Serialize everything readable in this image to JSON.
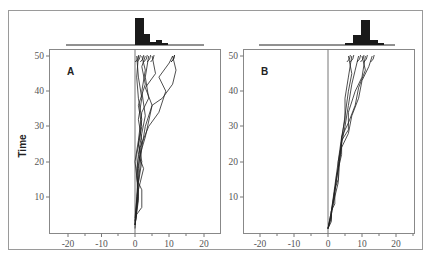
{
  "chart_data": [
    {
      "type": "line",
      "panel_label": "A",
      "title": "",
      "xlabel": "",
      "ylabel": "Time",
      "xlim": [
        -25,
        25
      ],
      "ylim": [
        0,
        52
      ],
      "x_ticks": [
        -20,
        -10,
        0,
        10,
        20
      ],
      "y_ticks": [
        10,
        20,
        30,
        40,
        50
      ],
      "description": "Many random-walk trajectories starting at x=0, t=0; clustered near x=0–5 with a few drifting to x≈10–12 by t=50",
      "series": [
        {
          "name": "path-1",
          "points": [
            [
              0,
              2
            ],
            [
              0.5,
              5
            ],
            [
              2,
              7
            ],
            [
              2,
              12
            ],
            [
              1,
              14
            ],
            [
              2,
              20
            ],
            [
              1,
              25
            ],
            [
              2,
              32
            ],
            [
              1,
              38
            ],
            [
              0.5,
              44
            ],
            [
              1,
              50
            ]
          ]
        },
        {
          "name": "path-2",
          "points": [
            [
              0,
              2
            ],
            [
              0.5,
              6
            ],
            [
              1,
              12
            ],
            [
              2.5,
              18
            ],
            [
              1,
              22
            ],
            [
              2,
              28
            ],
            [
              3,
              33
            ],
            [
              2,
              40
            ],
            [
              3,
              46
            ],
            [
              2,
              50
            ]
          ]
        },
        {
          "name": "path-3",
          "points": [
            [
              0,
              3
            ],
            [
              1,
              10
            ],
            [
              0.5,
              18
            ],
            [
              1.5,
              24
            ],
            [
              4,
              30
            ],
            [
              7,
              34
            ],
            [
              9,
              40
            ],
            [
              7,
              44
            ],
            [
              10,
              48
            ],
            [
              11,
              50
            ]
          ]
        },
        {
          "name": "path-4",
          "points": [
            [
              0,
              2
            ],
            [
              1,
              9
            ],
            [
              0.5,
              16
            ],
            [
              1.5,
              22
            ],
            [
              3,
              27
            ],
            [
              5,
              36
            ],
            [
              3,
              41
            ],
            [
              6,
              45
            ],
            [
              5,
              50
            ]
          ]
        },
        {
          "name": "path-5",
          "points": [
            [
              0,
              1
            ],
            [
              0.5,
              8
            ],
            [
              1,
              15
            ],
            [
              0.5,
              22
            ],
            [
              2,
              30
            ],
            [
              1,
              36
            ],
            [
              3,
              42
            ],
            [
              2,
              47
            ],
            [
              3,
              50
            ]
          ]
        },
        {
          "name": "path-6",
          "points": [
            [
              0,
              3
            ],
            [
              1,
              12
            ],
            [
              0,
              20
            ],
            [
              1,
              26
            ],
            [
              2,
              34
            ],
            [
              4,
              38
            ],
            [
              3,
              44
            ],
            [
              4,
              50
            ]
          ]
        },
        {
          "name": "path-7",
          "points": [
            [
              0,
              2
            ],
            [
              0.5,
              10
            ],
            [
              1,
              18
            ],
            [
              2,
              26
            ],
            [
              1,
              32
            ],
            [
              2,
              38
            ],
            [
              1,
              44
            ],
            [
              0.5,
              50
            ]
          ]
        },
        {
          "name": "path-8",
          "points": [
            [
              0,
              4
            ],
            [
              1,
              14
            ],
            [
              2,
              24
            ],
            [
              3,
              30
            ],
            [
              5,
              36
            ],
            [
              8,
              38
            ],
            [
              11,
              42
            ],
            [
              12,
              46
            ],
            [
              11,
              50
            ]
          ]
        }
      ],
      "histogram": {
        "bin_edges": [
          -20,
          -15,
          -10,
          -5,
          0,
          2.5,
          5,
          7.5,
          10,
          12.5,
          15,
          20
        ],
        "counts": [
          0,
          0,
          0,
          0,
          12,
          6,
          1,
          2,
          0.5,
          0,
          0
        ],
        "description": "Marginal distribution of positions at t=50; tallest bin at 0–2.5, decaying right-skewed"
      }
    },
    {
      "type": "line",
      "panel_label": "B",
      "title": "",
      "xlabel": "",
      "ylabel": "",
      "xlim": [
        -25,
        25
      ],
      "ylim": [
        0,
        52
      ],
      "x_ticks": [
        -20,
        -10,
        0,
        10,
        20
      ],
      "y_ticks": [
        10,
        20,
        30,
        40,
        50
      ],
      "description": "Biased random-walk trajectories drifting rightward from x=0 at t=0 to x≈5–12 at t=50",
      "series": [
        {
          "name": "path-1",
          "points": [
            [
              0,
              1
            ],
            [
              1,
              3
            ],
            [
              1,
              6
            ],
            [
              2,
              8
            ],
            [
              2,
              12
            ],
            [
              3,
              15
            ],
            [
              3,
              20
            ],
            [
              4,
              25
            ],
            [
              5,
              30
            ],
            [
              6,
              36
            ],
            [
              7,
              42
            ],
            [
              8,
              46
            ],
            [
              9,
              50
            ]
          ]
        },
        {
          "name": "path-2",
          "points": [
            [
              0,
              1
            ],
            [
              1,
              4
            ],
            [
              1,
              6
            ],
            [
              2,
              10
            ],
            [
              3,
              14
            ],
            [
              3.5,
              21
            ],
            [
              4,
              26
            ],
            [
              6,
              29
            ],
            [
              6,
              34
            ],
            [
              8,
              40
            ],
            [
              10,
              44
            ],
            [
              11,
              50
            ]
          ]
        },
        {
          "name": "path-3",
          "points": [
            [
              0,
              1
            ],
            [
              1,
              5
            ],
            [
              2,
              11
            ],
            [
              2.5,
              16
            ],
            [
              4,
              22
            ],
            [
              4,
              27
            ],
            [
              5,
              32
            ],
            [
              5,
              38
            ],
            [
              6,
              44
            ],
            [
              7,
              50
            ]
          ]
        },
        {
          "name": "path-4",
          "points": [
            [
              0,
              1
            ],
            [
              1,
              5
            ],
            [
              2,
              12
            ],
            [
              3,
              18
            ],
            [
              4,
              24
            ],
            [
              6,
              28
            ],
            [
              7,
              33
            ],
            [
              9,
              38
            ],
            [
              10,
              43
            ],
            [
              12,
              47
            ],
            [
              13,
              50
            ]
          ]
        },
        {
          "name": "path-5",
          "points": [
            [
              0,
              1
            ],
            [
              1,
              6
            ],
            [
              2,
              12
            ],
            [
              3,
              18
            ],
            [
              4,
              26
            ],
            [
              5,
              33
            ],
            [
              6,
              40
            ],
            [
              7,
              45
            ],
            [
              6,
              50
            ]
          ]
        },
        {
          "name": "path-6",
          "points": [
            [
              0,
              1
            ],
            [
              1,
              6
            ],
            [
              2,
              13
            ],
            [
              3,
              20
            ],
            [
              4,
              27
            ],
            [
              6,
              31
            ],
            [
              8,
              36
            ],
            [
              9,
              41
            ],
            [
              11,
              46
            ],
            [
              10,
              50
            ]
          ]
        }
      ],
      "histogram": {
        "bin_edges": [
          -20,
          0,
          5,
          7.5,
          10,
          12.5,
          15,
          20
        ],
        "counts": [
          0,
          0.3,
          2,
          6,
          2,
          0.3,
          0
        ],
        "description": "Marginal distribution at t=50; peaked around x≈10, roughly symmetric"
      }
    }
  ],
  "labels": {
    "y_axis": "Time",
    "panel_a": "A",
    "panel_b": "B",
    "x_ticks": [
      "-20",
      "-10",
      "0",
      "10",
      "20"
    ],
    "y_ticks": [
      "50",
      "40",
      "30",
      "20",
      "10"
    ]
  }
}
